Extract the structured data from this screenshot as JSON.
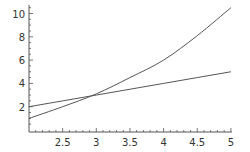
{
  "chart_data": {
    "type": "line",
    "title": "",
    "xlabel": "",
    "ylabel": "",
    "xlim": [
      2,
      5
    ],
    "ylim": [
      0,
      10.5
    ],
    "grid": false,
    "legend": null,
    "x_ticks": [
      2.5,
      3,
      3.5,
      4,
      4.5,
      5
    ],
    "x_tick_labels": [
      "2.5",
      "3",
      "3.5",
      "4",
      "4.5",
      "5"
    ],
    "y_ticks": [
      2,
      4,
      6,
      8,
      10
    ],
    "y_tick_labels": [
      "2",
      "4",
      "6",
      "8",
      "10"
    ],
    "x": [
      2,
      2.5,
      3,
      3.5,
      4,
      4.5,
      5
    ],
    "series": [
      {
        "name": "curve",
        "values": [
          1.0,
          2.0,
          3.1,
          4.5,
          6.0,
          8.1,
          10.5
        ],
        "color": "#555555"
      },
      {
        "name": "line",
        "values": [
          2.0,
          2.5,
          3.0,
          3.5,
          4.0,
          4.5,
          5.0
        ],
        "color": "#555555"
      }
    ],
    "axis_color": "#555555"
  }
}
